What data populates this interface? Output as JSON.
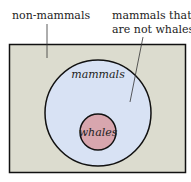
{
  "labels": {
    "outside": "non-mammals",
    "ring_line1": "mammals that",
    "ring_line2": "are not whales",
    "big_circle": "mammals",
    "small_circle": "whales"
  },
  "colors": {
    "rect_fill": "#dcdccf",
    "big_circle_fill": "#d8e2f4",
    "small_circle_fill": "#d8a6ae",
    "stroke": "#111111"
  }
}
